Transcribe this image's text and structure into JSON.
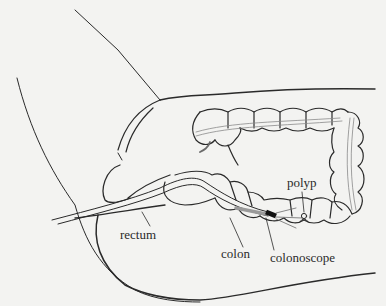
{
  "figure": {
    "type": "anatomical line illustration",
    "colors": {
      "background": "#f3f3f1",
      "ink": "#2a2a2a",
      "scope_tip": "#111111",
      "scope_gray": "#9a9a9a"
    }
  },
  "labels": {
    "polyp": "polyp",
    "rectum": "rectum",
    "colon": "colon",
    "colonoscope": "colonoscope"
  }
}
